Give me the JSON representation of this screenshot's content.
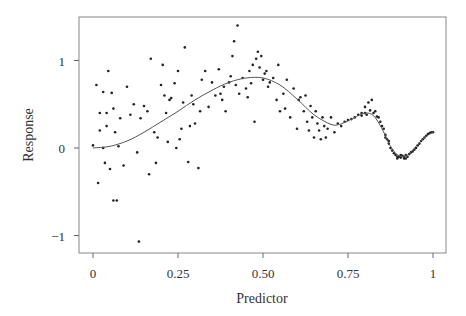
{
  "chart_data": {
    "type": "scatter",
    "title": "",
    "xlabel": "Predictor",
    "ylabel": "Response",
    "xlim": [
      -0.04,
      1.04
    ],
    "ylim": [
      -1.2,
      1.5
    ],
    "grid": false,
    "legend": "none",
    "x_ticks": [
      {
        "value": 0,
        "label": "0"
      },
      {
        "value": 0.25,
        "label": "0.25"
      },
      {
        "value": 0.5,
        "label": "0.50"
      },
      {
        "value": 0.75,
        "label": "0.75"
      },
      {
        "value": 1,
        "label": "1"
      }
    ],
    "y_ticks": [
      {
        "value": -1,
        "label": "−1"
      },
      {
        "value": 0,
        "label": "0"
      },
      {
        "value": 1,
        "label": "1"
      }
    ],
    "series": [
      {
        "name": "observations",
        "kind": "points",
        "points": [
          [
            0.0,
            0.03
          ],
          [
            0.01,
            0.72
          ],
          [
            0.015,
            -0.4
          ],
          [
            0.02,
            0.4
          ],
          [
            0.02,
            0.2
          ],
          [
            0.03,
            0.64
          ],
          [
            0.03,
            0.0
          ],
          [
            0.035,
            -0.17
          ],
          [
            0.04,
            0.4
          ],
          [
            0.04,
            0.25
          ],
          [
            0.045,
            0.88
          ],
          [
            0.05,
            -0.24
          ],
          [
            0.055,
            0.63
          ],
          [
            0.06,
            0.45
          ],
          [
            0.06,
            -0.6
          ],
          [
            0.065,
            0.18
          ],
          [
            0.07,
            -0.6
          ],
          [
            0.075,
            0.02
          ],
          [
            0.08,
            0.34
          ],
          [
            0.09,
            -0.2
          ],
          [
            0.1,
            0.7
          ],
          [
            0.11,
            0.38
          ],
          [
            0.12,
            0.5
          ],
          [
            0.13,
            -0.05
          ],
          [
            0.135,
            -1.07
          ],
          [
            0.14,
            0.34
          ],
          [
            0.15,
            0.48
          ],
          [
            0.16,
            0.42
          ],
          [
            0.165,
            -0.3
          ],
          [
            0.17,
            1.02
          ],
          [
            0.18,
            0.18
          ],
          [
            0.185,
            -0.17
          ],
          [
            0.19,
            0.12
          ],
          [
            0.2,
            0.72
          ],
          [
            0.205,
            0.95
          ],
          [
            0.21,
            0.6
          ],
          [
            0.215,
            0.4
          ],
          [
            0.22,
            0.07
          ],
          [
            0.225,
            0.55
          ],
          [
            0.23,
            0.57
          ],
          [
            0.24,
            0.74
          ],
          [
            0.245,
            0.0
          ],
          [
            0.25,
            0.88
          ],
          [
            0.255,
            0.1
          ],
          [
            0.26,
            0.22
          ],
          [
            0.265,
            0.52
          ],
          [
            0.27,
            1.15
          ],
          [
            0.28,
            -0.16
          ],
          [
            0.285,
            0.25
          ],
          [
            0.29,
            0.6
          ],
          [
            0.295,
            0.5
          ],
          [
            0.3,
            0.28
          ],
          [
            0.31,
            -0.23
          ],
          [
            0.315,
            0.42
          ],
          [
            0.32,
            0.78
          ],
          [
            0.33,
            0.88
          ],
          [
            0.34,
            0.47
          ],
          [
            0.35,
            0.75
          ],
          [
            0.36,
            0.6
          ],
          [
            0.37,
            0.9
          ],
          [
            0.375,
            0.62
          ],
          [
            0.38,
            0.55
          ],
          [
            0.385,
            0.7
          ],
          [
            0.39,
            0.42
          ],
          [
            0.4,
            0.75
          ],
          [
            0.405,
            0.82
          ],
          [
            0.41,
            1.05
          ],
          [
            0.415,
            1.22
          ],
          [
            0.42,
            0.72
          ],
          [
            0.425,
            1.4
          ],
          [
            0.43,
            0.62
          ],
          [
            0.44,
            0.8
          ],
          [
            0.45,
            0.68
          ],
          [
            0.455,
            0.58
          ],
          [
            0.46,
            0.88
          ],
          [
            0.465,
            0.74
          ],
          [
            0.47,
            0.95
          ],
          [
            0.475,
            0.3
          ],
          [
            0.48,
            1.02
          ],
          [
            0.485,
            1.1
          ],
          [
            0.49,
            0.92
          ],
          [
            0.495,
            1.05
          ],
          [
            0.5,
            0.78
          ],
          [
            0.505,
            0.85
          ],
          [
            0.51,
            0.88
          ],
          [
            0.515,
            0.7
          ],
          [
            0.52,
            0.75
          ],
          [
            0.53,
            0.8
          ],
          [
            0.54,
            0.55
          ],
          [
            0.545,
            0.95
          ],
          [
            0.55,
            0.42
          ],
          [
            0.56,
            0.62
          ],
          [
            0.565,
            0.45
          ],
          [
            0.57,
            0.78
          ],
          [
            0.58,
            0.35
          ],
          [
            0.59,
            0.68
          ],
          [
            0.6,
            0.22
          ],
          [
            0.605,
            0.55
          ],
          [
            0.61,
            0.58
          ],
          [
            0.62,
            0.42
          ],
          [
            0.625,
            0.6
          ],
          [
            0.63,
            0.3
          ],
          [
            0.635,
            0.2
          ],
          [
            0.64,
            0.48
          ],
          [
            0.645,
            0.35
          ],
          [
            0.65,
            0.12
          ],
          [
            0.655,
            0.42
          ],
          [
            0.66,
            0.28
          ],
          [
            0.665,
            0.2
          ],
          [
            0.67,
            0.1
          ],
          [
            0.675,
            0.35
          ],
          [
            0.68,
            0.25
          ],
          [
            0.685,
            0.12
          ],
          [
            0.69,
            0.22
          ],
          [
            0.7,
            0.35
          ],
          [
            0.71,
            0.18
          ],
          [
            0.72,
            0.28
          ],
          [
            0.73,
            0.25
          ],
          [
            0.74,
            0.3
          ],
          [
            0.75,
            0.32
          ],
          [
            0.76,
            0.33
          ],
          [
            0.77,
            0.35
          ],
          [
            0.78,
            0.38
          ],
          [
            0.79,
            0.4
          ],
          [
            0.8,
            0.47
          ],
          [
            0.805,
            0.38
          ],
          [
            0.81,
            0.52
          ],
          [
            0.815,
            0.43
          ],
          [
            0.82,
            0.55
          ],
          [
            0.825,
            0.4
          ],
          [
            0.83,
            0.42
          ],
          [
            0.835,
            0.36
          ],
          [
            0.84,
            0.35
          ],
          [
            0.845,
            0.3
          ],
          [
            0.85,
            0.25
          ],
          [
            0.855,
            0.22
          ],
          [
            0.86,
            0.15
          ],
          [
            0.865,
            0.1
          ],
          [
            0.87,
            0.05
          ],
          [
            0.875,
            0.0
          ],
          [
            0.88,
            -0.03
          ],
          [
            0.885,
            -0.06
          ],
          [
            0.89,
            -0.08
          ],
          [
            0.895,
            -0.1
          ],
          [
            0.9,
            -0.1
          ],
          [
            0.905,
            -0.11
          ],
          [
            0.91,
            -0.09
          ],
          [
            0.915,
            -0.1
          ],
          [
            0.92,
            -0.08
          ],
          [
            0.925,
            -0.1
          ],
          [
            0.93,
            -0.07
          ],
          [
            0.935,
            -0.05
          ],
          [
            0.94,
            -0.04
          ],
          [
            0.945,
            -0.02
          ],
          [
            0.95,
            0.0
          ],
          [
            0.955,
            0.03
          ],
          [
            0.96,
            0.05
          ],
          [
            0.965,
            0.08
          ],
          [
            0.97,
            0.1
          ],
          [
            0.975,
            0.12
          ],
          [
            0.98,
            0.14
          ],
          [
            0.985,
            0.16
          ],
          [
            0.99,
            0.17
          ],
          [
            0.995,
            0.18
          ],
          [
            1.0,
            0.18
          ],
          [
            0.895,
            -0.12
          ],
          [
            0.905,
            -0.08
          ],
          [
            0.915,
            -0.12
          ],
          [
            0.92,
            -0.12
          ],
          [
            0.86,
            0.12
          ],
          [
            0.87,
            0.08
          ],
          [
            0.79,
            0.37
          ],
          [
            0.8,
            0.4
          ]
        ]
      },
      {
        "name": "fitted curve",
        "kind": "line",
        "x": [
          0.0,
          0.05,
          0.1,
          0.15,
          0.2,
          0.25,
          0.3,
          0.35,
          0.4,
          0.45,
          0.5,
          0.55,
          0.6,
          0.65,
          0.7,
          0.725,
          0.75,
          0.775,
          0.8,
          0.825,
          0.85,
          0.875,
          0.9,
          0.925,
          0.95,
          0.975,
          1.0
        ],
        "y": [
          0.0,
          0.02,
          0.08,
          0.18,
          0.3,
          0.42,
          0.55,
          0.66,
          0.75,
          0.8,
          0.8,
          0.72,
          0.56,
          0.38,
          0.27,
          0.27,
          0.31,
          0.36,
          0.4,
          0.37,
          0.22,
          0.02,
          -0.09,
          -0.08,
          0.02,
          0.12,
          0.18
        ]
      }
    ]
  }
}
